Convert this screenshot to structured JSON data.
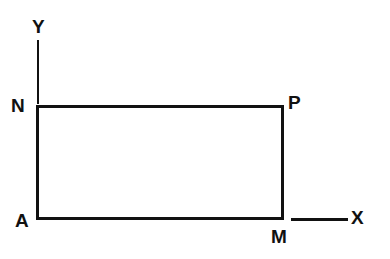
{
  "figure": {
    "background_color": "#ffffff",
    "stroke_color": "#111111",
    "shape": {
      "name": "rectangle",
      "vertices": [
        {
          "label": "N",
          "role": "top-left",
          "x": 36,
          "y": 105
        },
        {
          "label": "P",
          "role": "top-right",
          "x": 284,
          "y": 105
        },
        {
          "label": "M",
          "role": "bottom-right",
          "x": 284,
          "y": 220
        },
        {
          "label": "A",
          "role": "bottom-left",
          "x": 36,
          "y": 220
        }
      ],
      "width_px": 248,
      "height_px": 115,
      "stroke_width": 3
    },
    "axes": [
      {
        "label": "Y",
        "orientation": "vertical",
        "from": {
          "x": 38,
          "y": 40
        },
        "to": {
          "x": 38,
          "y": 104
        },
        "stroke_width": 2
      },
      {
        "label": "X",
        "orientation": "horizontal",
        "from": {
          "x": 291,
          "y": 219
        },
        "to": {
          "x": 348,
          "y": 219
        },
        "stroke_width": 3
      }
    ],
    "labels": {
      "vertex_n": "N",
      "vertex_p": "P",
      "vertex_a": "A",
      "vertex_m": "M",
      "axis_y": "Y",
      "axis_x": "X"
    }
  }
}
